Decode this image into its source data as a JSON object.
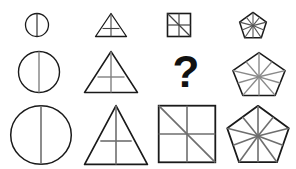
{
  "puzzle": {
    "type": "matrix-reasoning-puzzle",
    "background_color": "#ffffff",
    "outline_color": "#1a1a1a",
    "inner_line_color": "#777777",
    "missing_cell_label": "?",
    "rows": [
      {
        "row_index": 1,
        "size_label": "small",
        "cells": [
          {
            "shape": "circle",
            "divisions": "vertical-diameter",
            "segments": 2,
            "size": "small"
          },
          {
            "shape": "triangle",
            "divisions": "vertical-and-horizontal",
            "segments": 4,
            "size": "small"
          },
          {
            "shape": "square",
            "divisions": "cross-and-diagonal",
            "segments": 6,
            "size": "small"
          },
          {
            "shape": "pentagon",
            "divisions": "radial-spokes",
            "segments": 10,
            "size": "small"
          }
        ]
      },
      {
        "row_index": 2,
        "size_label": "medium",
        "cells": [
          {
            "shape": "circle",
            "divisions": "vertical-diameter",
            "segments": 2,
            "size": "medium"
          },
          {
            "shape": "triangle",
            "divisions": "vertical-and-horizontal",
            "segments": 4,
            "size": "medium"
          },
          {
            "shape": "question-mark",
            "divisions": "none",
            "segments": 0,
            "size": "medium"
          },
          {
            "shape": "pentagon",
            "divisions": "radial-spokes",
            "segments": 10,
            "size": "medium"
          }
        ]
      },
      {
        "row_index": 3,
        "size_label": "large",
        "cells": [
          {
            "shape": "circle",
            "divisions": "vertical-diameter",
            "segments": 2,
            "size": "large"
          },
          {
            "shape": "triangle",
            "divisions": "vertical-and-horizontal",
            "segments": 4,
            "size": "large"
          },
          {
            "shape": "square",
            "divisions": "cross-and-diagonal",
            "segments": 6,
            "size": "large"
          },
          {
            "shape": "pentagon",
            "divisions": "radial-spokes",
            "segments": 10,
            "size": "large"
          }
        ]
      }
    ]
  }
}
